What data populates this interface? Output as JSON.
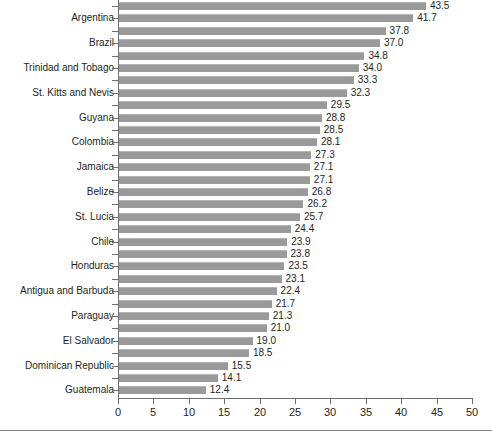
{
  "chart_data": {
    "type": "bar",
    "orientation": "horizontal",
    "title": "",
    "subtitle": "",
    "xlabel": "",
    "ylabel": "",
    "xlim": [
      0,
      50
    ],
    "xticks": [
      0,
      5,
      10,
      15,
      20,
      25,
      30,
      35,
      40,
      45,
      50
    ],
    "grid": false,
    "legend": null,
    "bar_color": "#9a9a9a",
    "axis_color": "#6d6e71",
    "text_color": "#231f20",
    "value_label_format": "one-decimal",
    "categories": [
      "",
      "Argentina",
      "",
      "Brazil",
      "",
      "Trinidad and Tobago",
      "",
      "St. Kitts and Nevis",
      "",
      "Guyana",
      "",
      "Colombia",
      "",
      "Jamaica",
      "",
      "Belize",
      "",
      "St. Lucia",
      "",
      "Chile",
      "",
      "Honduras",
      "",
      "Antigua and Barbuda",
      "",
      "Paraguay",
      "",
      "El Salvador",
      "",
      "Dominican Republic",
      "",
      "Guatemala"
    ],
    "visible_category_labels": [
      "Argentina",
      "Brazil",
      "Trinidad and Tobago",
      "St. Kitts and Nevis",
      "Guyana",
      "Colombia",
      "Jamaica",
      "Belize",
      "St. Lucia",
      "Chile",
      "Honduras",
      "Antigua and Barbuda",
      "Paraguay",
      "El Salvador",
      "Dominican Republic",
      "Guatemala"
    ],
    "values": [
      43.5,
      41.7,
      37.8,
      37.0,
      34.8,
      34.0,
      33.3,
      32.3,
      29.5,
      28.8,
      28.5,
      28.1,
      27.3,
      27.1,
      27.1,
      26.8,
      26.2,
      25.7,
      24.4,
      23.9,
      23.8,
      23.5,
      23.1,
      22.4,
      21.7,
      21.3,
      21.0,
      19.0,
      18.5,
      15.5,
      14.1,
      12.4
    ],
    "bars": [
      {
        "label": "",
        "value": 43.5
      },
      {
        "label": "Argentina",
        "value": 41.7
      },
      {
        "label": "",
        "value": 37.8
      },
      {
        "label": "Brazil",
        "value": 37.0
      },
      {
        "label": "",
        "value": 34.8
      },
      {
        "label": "Trinidad and Tobago",
        "value": 34.0
      },
      {
        "label": "",
        "value": 33.3
      },
      {
        "label": "St. Kitts and Nevis",
        "value": 32.3
      },
      {
        "label": "",
        "value": 29.5
      },
      {
        "label": "Guyana",
        "value": 28.8
      },
      {
        "label": "",
        "value": 28.5
      },
      {
        "label": "Colombia",
        "value": 28.1
      },
      {
        "label": "",
        "value": 27.3
      },
      {
        "label": "Jamaica",
        "value": 27.1
      },
      {
        "label": "",
        "value": 27.1
      },
      {
        "label": "Belize",
        "value": 26.8
      },
      {
        "label": "",
        "value": 26.2
      },
      {
        "label": "St. Lucia",
        "value": 25.7
      },
      {
        "label": "",
        "value": 24.4
      },
      {
        "label": "Chile",
        "value": 23.9
      },
      {
        "label": "",
        "value": 23.8
      },
      {
        "label": "Honduras",
        "value": 23.5
      },
      {
        "label": "",
        "value": 23.1
      },
      {
        "label": "Antigua and Barbuda",
        "value": 22.4
      },
      {
        "label": "",
        "value": 21.7
      },
      {
        "label": "Paraguay",
        "value": 21.3
      },
      {
        "label": "",
        "value": 21.0
      },
      {
        "label": "El Salvador",
        "value": 19.0
      },
      {
        "label": "",
        "value": 18.5
      },
      {
        "label": "Dominican Republic",
        "value": 15.5
      },
      {
        "label": "",
        "value": 14.1
      },
      {
        "label": "Guatemala",
        "value": 12.4
      }
    ]
  }
}
